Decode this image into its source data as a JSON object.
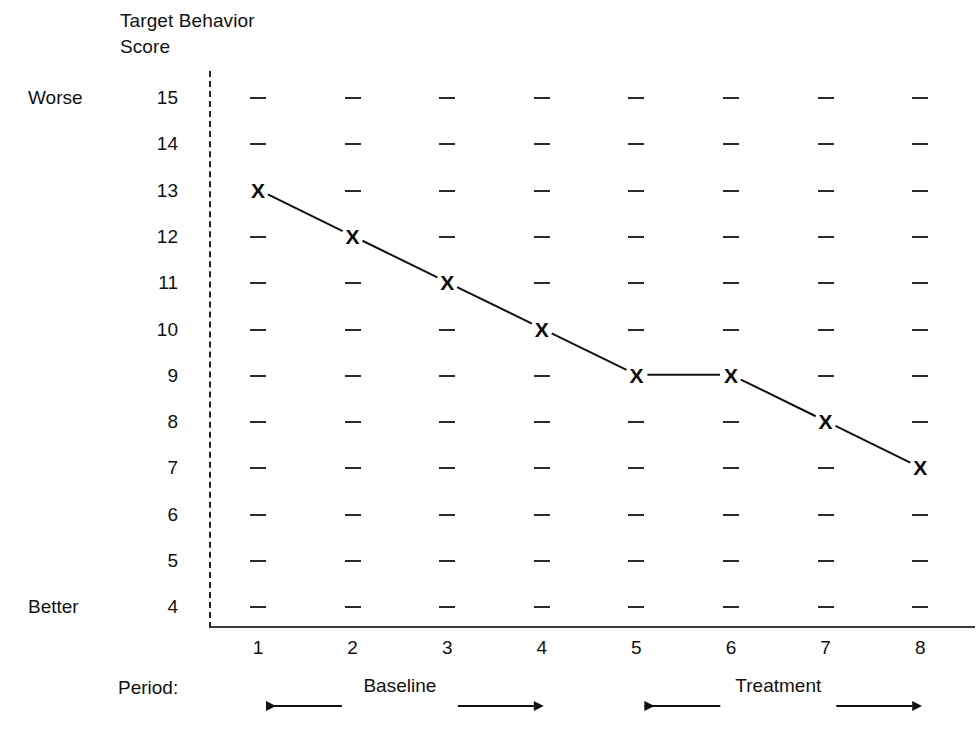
{
  "chart_data": {
    "type": "line",
    "title": "Target Behavior Score",
    "title_lines": [
      "Target Behavior",
      "Score"
    ],
    "xlabel": "Period:",
    "ylabel": "Target Behavior Score",
    "x": [
      1,
      2,
      3,
      4,
      5,
      6,
      7,
      8
    ],
    "values": [
      13,
      12,
      11,
      10,
      9,
      9,
      8,
      7
    ],
    "series": [
      {
        "name": "Target Behavior Score",
        "values": [
          13,
          12,
          11,
          10,
          9,
          9,
          8,
          7
        ]
      }
    ],
    "y_ticks": [
      15,
      14,
      13,
      12,
      11,
      10,
      9,
      8,
      7,
      6,
      5,
      4
    ],
    "x_ticks": [
      "1",
      "2",
      "3",
      "4",
      "5",
      "6",
      "7",
      "8"
    ],
    "ylim": [
      4,
      15
    ],
    "xlim": [
      1,
      8
    ],
    "grid": "dash-marks",
    "legend": "none",
    "marker": "X",
    "direction_high_label": "Worse",
    "direction_low_label": "Better",
    "phase_line_after_period": 0,
    "phases": [
      {
        "label": "Baseline",
        "start_period": 1,
        "end_period": 4
      },
      {
        "label": "Treatment",
        "start_period": 5,
        "end_period": 8
      }
    ],
    "annotations": [
      {
        "text": "Worse",
        "at_y": 15
      },
      {
        "text": "Better",
        "at_y": 4
      }
    ],
    "colors": {
      "line": "#111111",
      "marker": "#0b0b0b",
      "axis": "#3a3a3a",
      "grid_dash": "#2b2b2b",
      "phase_line": "#222222",
      "background": "#ffffff",
      "text": "#111111"
    }
  },
  "axis": {
    "title_line_1": "Target Behavior",
    "title_line_2": "Score",
    "worse_label": "Worse",
    "better_label": "Better",
    "period_label": "Period:"
  },
  "y_tick_labels": [
    "15",
    "14",
    "13",
    "12",
    "11",
    "10",
    "9",
    "8",
    "7",
    "6",
    "5",
    "4"
  ],
  "x_tick_labels": [
    "1",
    "2",
    "3",
    "4",
    "5",
    "6",
    "7",
    "8"
  ],
  "markers": [
    "X",
    "X",
    "X",
    "X",
    "X",
    "X",
    "X",
    "X"
  ],
  "phases": {
    "baseline_label": "Baseline",
    "treatment_label": "Treatment"
  }
}
